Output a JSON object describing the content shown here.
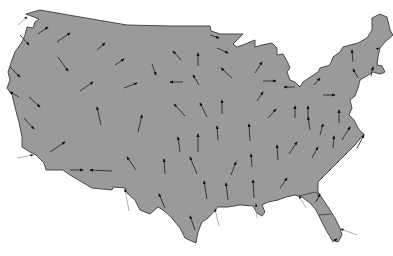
{
  "map": {
    "title": "Contiguous United States vector field",
    "land_color": "#9a9a9a",
    "outline_color": "#3a3a3a",
    "arrow_color": "#222222",
    "outline": [
      [
        26,
        14
      ],
      [
        40,
        10
      ],
      [
        80,
        17
      ],
      [
        127,
        25
      ],
      [
        170,
        26
      ],
      [
        210,
        26
      ],
      [
        211,
        31
      ],
      [
        220,
        34
      ],
      [
        243,
        34
      ],
      [
        233,
        44
      ],
      [
        237,
        47
      ],
      [
        240,
        46
      ],
      [
        255,
        40
      ],
      [
        255,
        47
      ],
      [
        262,
        45
      ],
      [
        272,
        43
      ],
      [
        277,
        48
      ],
      [
        277,
        55
      ],
      [
        283,
        54
      ],
      [
        288,
        63
      ],
      [
        290,
        68
      ],
      [
        287,
        72
      ],
      [
        290,
        80
      ],
      [
        295,
        82
      ],
      [
        300,
        87
      ],
      [
        303,
        82
      ],
      [
        318,
        72
      ],
      [
        320,
        68
      ],
      [
        330,
        65
      ],
      [
        333,
        57
      ],
      [
        340,
        52
      ],
      [
        343,
        47
      ],
      [
        358,
        43
      ],
      [
        367,
        38
      ],
      [
        372,
        30
      ],
      [
        372,
        18
      ],
      [
        380,
        14
      ],
      [
        387,
        17
      ],
      [
        390,
        30
      ],
      [
        393,
        35
      ],
      [
        385,
        42
      ],
      [
        380,
        48
      ],
      [
        378,
        57
      ],
      [
        377,
        65
      ],
      [
        382,
        66
      ],
      [
        385,
        72
      ],
      [
        380,
        74
      ],
      [
        373,
        72
      ],
      [
        365,
        77
      ],
      [
        360,
        80
      ],
      [
        358,
        88
      ],
      [
        355,
        96
      ],
      [
        350,
        100
      ],
      [
        352,
        108
      ],
      [
        349,
        115
      ],
      [
        354,
        120
      ],
      [
        358,
        128
      ],
      [
        362,
        133
      ],
      [
        364,
        134
      ],
      [
        355,
        145
      ],
      [
        345,
        155
      ],
      [
        335,
        165
      ],
      [
        325,
        175
      ],
      [
        318,
        182
      ],
      [
        318,
        192
      ],
      [
        322,
        198
      ],
      [
        328,
        207
      ],
      [
        335,
        218
      ],
      [
        340,
        228
      ],
      [
        342,
        235
      ],
      [
        338,
        242
      ],
      [
        332,
        240
      ],
      [
        326,
        230
      ],
      [
        320,
        218
      ],
      [
        316,
        210
      ],
      [
        310,
        203
      ],
      [
        302,
        197
      ],
      [
        295,
        195
      ],
      [
        286,
        197
      ],
      [
        278,
        200
      ],
      [
        268,
        202
      ],
      [
        262,
        205
      ],
      [
        265,
        212
      ],
      [
        262,
        216
      ],
      [
        257,
        213
      ],
      [
        253,
        206
      ],
      [
        240,
        205
      ],
      [
        228,
        207
      ],
      [
        218,
        207
      ],
      [
        208,
        218
      ],
      [
        202,
        222
      ],
      [
        198,
        232
      ],
      [
        196,
        243
      ],
      [
        185,
        238
      ],
      [
        180,
        228
      ],
      [
        170,
        216
      ],
      [
        163,
        210
      ],
      [
        158,
        207
      ],
      [
        150,
        214
      ],
      [
        140,
        210
      ],
      [
        135,
        200
      ],
      [
        127,
        193
      ],
      [
        125,
        188
      ],
      [
        113,
        187
      ],
      [
        112,
        190
      ],
      [
        92,
        188
      ],
      [
        70,
        175
      ],
      [
        63,
        170
      ],
      [
        46,
        170
      ],
      [
        44,
        163
      ],
      [
        36,
        155
      ],
      [
        30,
        152
      ],
      [
        22,
        147
      ],
      [
        22,
        137
      ],
      [
        19,
        122
      ],
      [
        17,
        115
      ],
      [
        14,
        103
      ],
      [
        12,
        95
      ],
      [
        7,
        88
      ],
      [
        10,
        80
      ],
      [
        8,
        72
      ],
      [
        12,
        60
      ],
      [
        15,
        52
      ],
      [
        22,
        42
      ],
      [
        25,
        35
      ],
      [
        27,
        27
      ],
      [
        33,
        28
      ],
      [
        35,
        22
      ],
      [
        39,
        19
      ],
      [
        26,
        14
      ]
    ],
    "internal_borders": [
      [
        [
          299,
          196
        ],
        [
          315,
          192
        ],
        [
          320,
          195
        ]
      ],
      [
        [
          319,
          215
        ],
        [
          331,
          214
        ]
      ]
    ],
    "arrows": [
      {
        "tail": [
          18,
          25
        ],
        "head": [
          27,
          17
        ],
        "outside": true
      },
      {
        "tail": [
          38,
          34
        ],
        "head": [
          48,
          27
        ]
      },
      {
        "tail": [
          57,
          42
        ],
        "head": [
          70,
          33
        ]
      },
      {
        "tail": [
          20,
          35
        ],
        "head": [
          29,
          45
        ]
      },
      {
        "tail": [
          58,
          57
        ],
        "head": [
          68,
          71
        ]
      },
      {
        "tail": [
          97,
          50
        ],
        "head": [
          105,
          43
        ]
      },
      {
        "tail": [
          115,
          65
        ],
        "head": [
          124,
          59
        ]
      },
      {
        "tail": [
          10,
          67
        ],
        "head": [
          20,
          77
        ]
      },
      {
        "tail": [
          80,
          91
        ],
        "head": [
          93,
          82
        ]
      },
      {
        "tail": [
          124,
          88
        ],
        "head": [
          137,
          83
        ]
      },
      {
        "tail": [
          181,
          60
        ],
        "head": [
          173,
          51
        ]
      },
      {
        "tail": [
          198,
          66
        ],
        "head": [
          198,
          53
        ]
      },
      {
        "tail": [
          152,
          64
        ],
        "head": [
          156,
          75
        ]
      },
      {
        "tail": [
          183,
          82
        ],
        "head": [
          170,
          82
        ]
      },
      {
        "tail": [
          199,
          85
        ],
        "head": [
          193,
          75
        ]
      },
      {
        "tail": [
          232,
          78
        ],
        "head": [
          221,
          68
        ]
      },
      {
        "tail": [
          210,
          35
        ],
        "head": [
          219,
          38
        ]
      },
      {
        "tail": [
          217,
          48
        ],
        "head": [
          228,
          53
        ]
      },
      {
        "tail": [
          255,
          73
        ],
        "head": [
          262,
          62
        ]
      },
      {
        "tail": [
          263,
          81
        ],
        "head": [
          276,
          81
        ]
      },
      {
        "tail": [
          295,
          87
        ],
        "head": [
          284,
          87
        ]
      },
      {
        "tail": [
          257,
          101
        ],
        "head": [
          263,
          92
        ]
      },
      {
        "tail": [
          268,
          118
        ],
        "head": [
          276,
          109
        ]
      },
      {
        "tail": [
          295,
          118
        ],
        "head": [
          295,
          106
        ]
      },
      {
        "tail": [
          323,
          95
        ],
        "head": [
          335,
          95
        ]
      },
      {
        "tail": [
          314,
          85
        ],
        "head": [
          320,
          78
        ]
      },
      {
        "tail": [
          353,
          62
        ],
        "head": [
          352,
          50
        ]
      },
      {
        "tail": [
          358,
          78
        ],
        "head": [
          353,
          69
        ]
      },
      {
        "tail": [
          371,
          76
        ],
        "head": [
          373,
          67
        ]
      },
      {
        "tail": [
          366,
          54
        ],
        "head": [
          379,
          48
        ],
        "outside": true
      },
      {
        "tail": [
          185,
          116
        ],
        "head": [
          174,
          104
        ]
      },
      {
        "tail": [
          207,
          117
        ],
        "head": [
          200,
          103
        ]
      },
      {
        "tail": [
          222,
          114
        ],
        "head": [
          222,
          100
        ]
      },
      {
        "tail": [
          138,
          132
        ],
        "head": [
          142,
          115
        ]
      },
      {
        "tail": [
          101,
          125
        ],
        "head": [
          97,
          107
        ]
      },
      {
        "tail": [
          19,
          97
        ],
        "head": [
          10,
          92
        ],
        "reverse": true
      },
      {
        "tail": [
          29,
          97
        ],
        "head": [
          40,
          107
        ]
      },
      {
        "tail": [
          24,
          118
        ],
        "head": [
          34,
          129
        ]
      },
      {
        "tail": [
          50,
          152
        ],
        "head": [
          65,
          142
        ]
      },
      {
        "tail": [
          17,
          158
        ],
        "head": [
          33,
          155
        ],
        "outside": true
      },
      {
        "tail": [
          70,
          170
        ],
        "head": [
          83,
          170
        ]
      },
      {
        "tail": [
          112,
          171
        ],
        "head": [
          90,
          170
        ]
      },
      {
        "tail": [
          218,
          140
        ],
        "head": [
          217,
          126
        ]
      },
      {
        "tail": [
          250,
          141
        ],
        "head": [
          249,
          124
        ]
      },
      {
        "tail": [
          180,
          152
        ],
        "head": [
          178,
          137
        ]
      },
      {
        "tail": [
          198,
          152
        ],
        "head": [
          198,
          134
        ]
      },
      {
        "tail": [
          136,
          170
        ],
        "head": [
          127,
          157
        ]
      },
      {
        "tail": [
          165,
          174
        ],
        "head": [
          164,
          159
        ]
      },
      {
        "tail": [
          197,
          174
        ],
        "head": [
          190,
          157
        ]
      },
      {
        "tail": [
          231,
          175
        ],
        "head": [
          236,
          162
        ]
      },
      {
        "tail": [
          252,
          167
        ],
        "head": [
          251,
          154
        ]
      },
      {
        "tail": [
          207,
          199
        ],
        "head": [
          204,
          181
        ]
      },
      {
        "tail": [
          228,
          200
        ],
        "head": [
          226,
          183
        ]
      },
      {
        "tail": [
          254,
          198
        ],
        "head": [
          253,
          180
        ]
      },
      {
        "tail": [
          165,
          208
        ],
        "head": [
          159,
          194
        ]
      },
      {
        "tail": [
          195,
          230
        ],
        "head": [
          190,
          216
        ]
      },
      {
        "tail": [
          219,
          226
        ],
        "head": [
          215,
          209
        ],
        "outside": true
      },
      {
        "tail": [
          257,
          218
        ],
        "head": [
          256,
          204
        ],
        "outside": true
      },
      {
        "tail": [
          129,
          211
        ],
        "head": [
          125,
          189
        ],
        "outside": true
      },
      {
        "tail": [
          310,
          130
        ],
        "head": [
          308,
          117
        ]
      },
      {
        "tail": [
          320,
          135
        ],
        "head": [
          323,
          124
        ]
      },
      {
        "tail": [
          333,
          148
        ],
        "head": [
          334,
          136
        ]
      },
      {
        "tail": [
          342,
          140
        ],
        "head": [
          350,
          127
        ]
      },
      {
        "tail": [
          357,
          148
        ],
        "head": [
          364,
          135
        ]
      },
      {
        "tail": [
          278,
          160
        ],
        "head": [
          277,
          145
        ]
      },
      {
        "tail": [
          289,
          154
        ],
        "head": [
          297,
          142
        ]
      },
      {
        "tail": [
          312,
          158
        ],
        "head": [
          318,
          147
        ]
      },
      {
        "tail": [
          339,
          123
        ],
        "head": [
          339,
          110
        ]
      },
      {
        "tail": [
          308,
          118
        ],
        "head": [
          308,
          106
        ]
      },
      {
        "tail": [
          280,
          188
        ],
        "head": [
          287,
          178
        ]
      },
      {
        "tail": [
          306,
          208
        ],
        "head": [
          299,
          196
        ],
        "outside": true
      },
      {
        "tail": [
          316,
          202
        ],
        "head": [
          320,
          194
        ]
      },
      {
        "tail": [
          357,
          235
        ],
        "head": [
          341,
          229
        ],
        "outside": true
      },
      {
        "tail": [
          332,
          242
        ],
        "head": [
          337,
          239
        ]
      }
    ]
  }
}
